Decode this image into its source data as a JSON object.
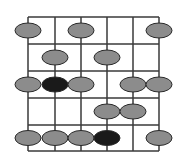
{
  "diagram": {
    "type": "fretboard-scale-pattern",
    "strings": 6,
    "frets": 5,
    "colors": {
      "background": "#ffffff",
      "grid": "#3a3a3a",
      "note": "#8c8c8c",
      "root": "#1a1a1a",
      "outline": "#2a2a2a"
    },
    "grid": {
      "string_x": [
        28,
        55,
        81,
        107,
        133,
        159
      ],
      "fret_y": [
        17,
        44,
        71,
        98,
        125,
        151
      ]
    },
    "notes": [
      {
        "fret": 1,
        "string": 1,
        "root": false
      },
      {
        "fret": 1,
        "string": 3,
        "root": false
      },
      {
        "fret": 1,
        "string": 6,
        "root": false
      },
      {
        "fret": 2,
        "string": 2,
        "root": false
      },
      {
        "fret": 2,
        "string": 4,
        "root": false
      },
      {
        "fret": 3,
        "string": 1,
        "root": false
      },
      {
        "fret": 3,
        "string": 2,
        "root": true
      },
      {
        "fret": 3,
        "string": 3,
        "root": false
      },
      {
        "fret": 3,
        "string": 5,
        "root": false
      },
      {
        "fret": 3,
        "string": 6,
        "root": false
      },
      {
        "fret": 4,
        "string": 4,
        "root": false
      },
      {
        "fret": 4,
        "string": 5,
        "root": false
      },
      {
        "fret": 5,
        "string": 1,
        "root": false
      },
      {
        "fret": 5,
        "string": 2,
        "root": false
      },
      {
        "fret": 5,
        "string": 3,
        "root": false
      },
      {
        "fret": 5,
        "string": 4,
        "root": true
      },
      {
        "fret": 5,
        "string": 6,
        "root": false
      }
    ]
  }
}
